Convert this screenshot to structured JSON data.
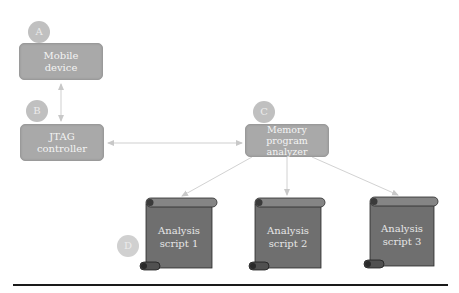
{
  "nodes": {
    "mobile": {
      "label_line1": "Mobile",
      "label_line2": "device",
      "marker": "A"
    },
    "jtag": {
      "label_line1": "JTAG",
      "label_line2": "controller",
      "marker": "B"
    },
    "memory": {
      "label_line1": "Memory",
      "label_line2": "program analyzer",
      "marker": "C"
    },
    "scripts": [
      {
        "label_line1": "Analysis",
        "label_line2": "script 1"
      },
      {
        "label_line1": "Analysis",
        "label_line2": "script 2"
      },
      {
        "label_line1": "Analysis",
        "label_line2": "script 3"
      }
    ],
    "scripts_marker": "D"
  },
  "colors": {
    "box_fill": "#a9a9a9",
    "scroll_fill": "#6f6f6f",
    "marker_fill": "#c0c0c0",
    "arrow": "#cfcfcf",
    "baseline": "#1a1a1a"
  }
}
